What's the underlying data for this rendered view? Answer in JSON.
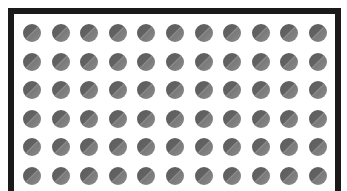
{
  "canvas": {
    "frame": {
      "border_color": "#1a1a1a",
      "background": "#ffffff"
    },
    "grid": {
      "rows": 6,
      "columns": 11,
      "dot_diameter": 18,
      "col_spacing": 28.6,
      "row_spacing": 28.5,
      "dot_colors": {
        "dark": "#5e5e5e",
        "light": "#8a8a8a"
      }
    }
  }
}
